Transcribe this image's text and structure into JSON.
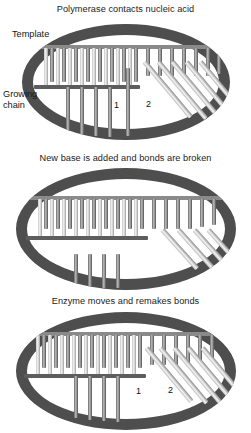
{
  "figure": {
    "type": "three-panel scientific diagram",
    "background_color": "#ffffff",
    "enzyme_color": "#4e4e4e",
    "strand_color": "#777777",
    "base_color": "#cfcfcf"
  },
  "panels": [
    {
      "id": "panel-0",
      "caption": "Polymerase contacts nucleic acid",
      "labels": [
        {
          "name": "template",
          "text": "Template"
        },
        {
          "name": "growing-chain-line1",
          "text": "Growing"
        },
        {
          "name": "growing-chain-line2",
          "text": "chain"
        },
        {
          "name": "site-1",
          "text": "1"
        },
        {
          "name": "site-2",
          "text": "2"
        }
      ],
      "diagram": {
        "template_strand": true,
        "growing_chain_strand": true,
        "paired_rungs": 12,
        "free_rungs": 5,
        "unpaired_rungs_right": 8,
        "diagonal_strands": 5
      }
    },
    {
      "id": "panel-1",
      "caption": "New base is added and bonds are broken",
      "labels": [],
      "diagram": {
        "template_strand": true,
        "growing_chain_strand": true,
        "paired_rungs": 13,
        "free_rungs": 4,
        "unpaired_rungs_right": 9,
        "diagonal_strands": 4
      }
    },
    {
      "id": "panel-2",
      "caption": "Enzyme moves and remakes bonds",
      "labels": [
        {
          "name": "site-1",
          "text": "1"
        },
        {
          "name": "site-2",
          "text": "2"
        }
      ],
      "diagram": {
        "template_strand": true,
        "growing_chain_strand": true,
        "paired_rungs": 12,
        "free_rungs": 5,
        "unpaired_rungs_right": 8,
        "diagonal_strands": 5
      }
    }
  ]
}
